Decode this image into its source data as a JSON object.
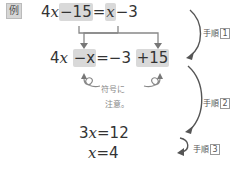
{
  "example_label": "例",
  "equations": {
    "line1": {
      "parts": [
        "4",
        "x",
        "−15",
        "=",
        "x",
        "−3"
      ]
    },
    "line2": {
      "parts": [
        "4",
        "x",
        "−x",
        "=−3",
        "+15"
      ]
    },
    "line3": {
      "text_num": "3",
      "text_var": "x",
      "text_rest": "=12"
    },
    "line4": {
      "text_var": "x",
      "text_rest": "=4"
    }
  },
  "note": {
    "line1": "符号に",
    "line2": "注意。"
  },
  "steps": [
    {
      "label": "手順",
      "num": "1"
    },
    {
      "label": "手順",
      "num": "2"
    },
    {
      "label": "手順",
      "num": "3"
    }
  ],
  "colors": {
    "highlight": "#d9d9d9",
    "arrow": "#666666",
    "text": "#333333"
  }
}
